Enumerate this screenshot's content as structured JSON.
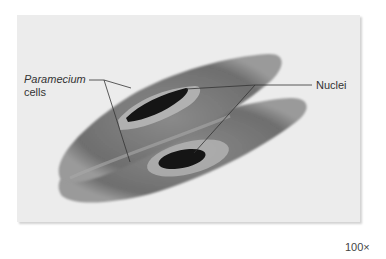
{
  "figure": {
    "labels": {
      "cells_label_line1": "Paramecium",
      "cells_label_line2": "cells",
      "nuclei_label": "Nuclei"
    },
    "magnification": "100×",
    "colors": {
      "panel_background": "#ececec",
      "cell_body": "#7a7a7a",
      "nucleus": "#151515",
      "leader_line": "#333333"
    }
  }
}
